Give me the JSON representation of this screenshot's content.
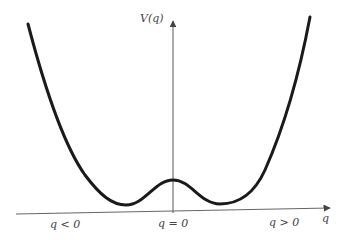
{
  "diagram": {
    "type": "double-well potential",
    "y_axis_label": "V(q)",
    "x_axis_label": "q",
    "region_labels": {
      "left": "q < 0",
      "center": "q = 0",
      "right": "q > 0"
    },
    "colors": {
      "curve": "#1a1a1a",
      "axis": "#555555",
      "text": "#444444",
      "background": "#ffffff"
    }
  }
}
